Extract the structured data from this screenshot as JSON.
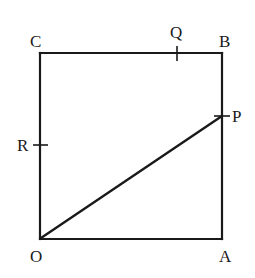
{
  "diagram": {
    "type": "square-with-points",
    "vertices": {
      "O": {
        "label": "O",
        "x": 40,
        "y": 239
      },
      "A": {
        "label": "A",
        "x": 222,
        "y": 239
      },
      "B": {
        "label": "B",
        "x": 222,
        "y": 53
      },
      "C": {
        "label": "C",
        "x": 40,
        "y": 53
      }
    },
    "points": {
      "P": {
        "label": "P",
        "on_side": "AB",
        "x": 222,
        "y": 116
      },
      "Q": {
        "label": "Q",
        "on_side": "CB",
        "x": 177,
        "y": 53
      },
      "R": {
        "label": "R",
        "on_side": "OC",
        "x": 40,
        "y": 145
      }
    },
    "segments": [
      {
        "from": "O",
        "to": "P"
      }
    ],
    "labels": {
      "O": "O",
      "A": "A",
      "B": "B",
      "C": "C",
      "P": "P",
      "Q": "Q",
      "R": "R"
    },
    "colors": {
      "stroke": "#1a1a1a",
      "background": "#ffffff"
    }
  }
}
